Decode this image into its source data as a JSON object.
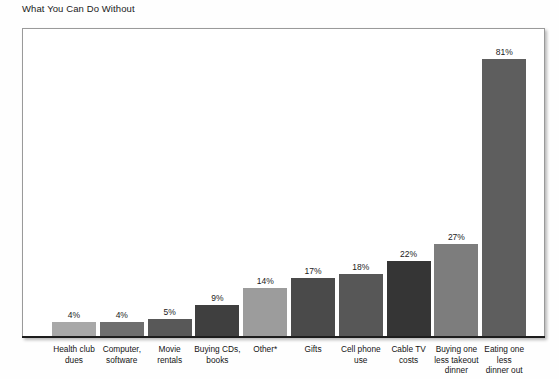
{
  "page": {
    "background_color": "#fefefe"
  },
  "chart_title": "What You Can Do Without",
  "plot": {
    "frame_border_color": "#9a9a9a",
    "frame_background": "#ffffff",
    "axis_color": "#1d1d1d"
  },
  "chart_data": {
    "type": "bar",
    "title": "What You Can Do Without",
    "xlabel": "",
    "ylabel": "",
    "ylim": [
      0,
      91
    ],
    "grid": false,
    "legend": "none",
    "value_suffix": "%",
    "categories": [
      "Health club dues",
      "Computer, software",
      "Movie rentals",
      "Buying CDs, books",
      "Other*",
      "Gifts",
      "Cell phone use",
      "Cable TV costs",
      "Buying one less takeout dinner",
      "Eating one less dinner out"
    ],
    "values": [
      4,
      4,
      5,
      9,
      14,
      17,
      18,
      22,
      27,
      81
    ],
    "value_labels": [
      "4%",
      "4%",
      "5%",
      "9%",
      "14%",
      "17%",
      "18%",
      "22%",
      "27%",
      "81%"
    ],
    "bar_colors": [
      "#a8a8a8",
      "#6e6e6e",
      "#585858",
      "#3f3f3f",
      "#9c9c9c",
      "#4a4a4a",
      "#575757",
      "#353535",
      "#7d7d7d",
      "#5e5e5e"
    ],
    "bars": [
      {
        "label": "Health club dues",
        "label_lines": [
          "Health club",
          "dues"
        ],
        "value": 4,
        "value_label": "4%",
        "color": "#a8a8a8"
      },
      {
        "label": "Computer, software",
        "label_lines": [
          "Computer,",
          "software"
        ],
        "value": 4,
        "value_label": "4%",
        "color": "#6e6e6e"
      },
      {
        "label": "Movie rentals",
        "label_lines": [
          "Movie",
          "rentals"
        ],
        "value": 5,
        "value_label": "5%",
        "color": "#585858"
      },
      {
        "label": "Buying CDs, books",
        "label_lines": [
          "Buying CDs,",
          "books"
        ],
        "value": 9,
        "value_label": "9%",
        "color": "#3f3f3f"
      },
      {
        "label": "Other*",
        "label_lines": [
          "Other*"
        ],
        "value": 14,
        "value_label": "14%",
        "color": "#9c9c9c"
      },
      {
        "label": "Gifts",
        "label_lines": [
          "Gifts"
        ],
        "value": 17,
        "value_label": "17%",
        "color": "#4a4a4a"
      },
      {
        "label": "Cell phone use",
        "label_lines": [
          "Cell phone",
          "use"
        ],
        "value": 18,
        "value_label": "18%",
        "color": "#575757"
      },
      {
        "label": "Cable TV costs",
        "label_lines": [
          "Cable TV",
          "costs"
        ],
        "value": 22,
        "value_label": "22%",
        "color": "#353535"
      },
      {
        "label": "Buying one less takeout dinner",
        "label_lines": [
          "Buying one",
          "less takeout",
          "dinner"
        ],
        "value": 27,
        "value_label": "27%",
        "color": "#7d7d7d"
      },
      {
        "label": "Eating one less dinner out",
        "label_lines": [
          "Eating one",
          "less",
          "dinner out"
        ],
        "value": 81,
        "value_label": "81%",
        "color": "#5e5e5e"
      }
    ]
  }
}
